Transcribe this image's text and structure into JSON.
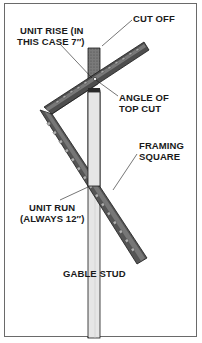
{
  "figure": {
    "labels": {
      "cut_off": "CUT OFF",
      "unit_rise_line1": "UNIT RISE (IN",
      "unit_rise_line2": "THIS CASE 7″)",
      "angle_line1": "ANGLE OF",
      "angle_line2": "TOP CUT",
      "framing_line1": "FRAMING",
      "framing_line2": "SQUARE",
      "unit_run_line1": "UNIT RUN",
      "unit_run_line2": "(ALWAYS 12″)",
      "gable_stud": "GABLE STUD"
    },
    "colors": {
      "stud_fill": "#e4e4e4",
      "cutoff_fill": "#6e6e6e",
      "square_fill": "#5a5a5a",
      "square_dark": "#2e2e2e",
      "tick_fill": "#9a9a9a",
      "border": "#6a6a6a",
      "text": "#1a1a1a"
    }
  }
}
